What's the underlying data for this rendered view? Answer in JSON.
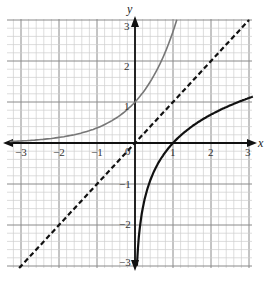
{
  "chart_data": {
    "type": "line",
    "title": "",
    "xlabel": "x",
    "ylabel": "y",
    "xlim": [
      -3.3,
      3.1
    ],
    "ylim": [
      -3.05,
      3.0
    ],
    "grid": true,
    "minor_grid_per_unit": 5,
    "x_ticks": [
      -3,
      -2,
      -1,
      1,
      2,
      3
    ],
    "y_ticks": [
      -3,
      -2,
      -1,
      1,
      2,
      3
    ],
    "x_tick_labels": [
      "−3",
      "−2",
      "−1",
      "1",
      "2",
      "3"
    ],
    "y_tick_labels": [
      "−3",
      "−2",
      "−1",
      "1",
      "2",
      "3"
    ],
    "origin_label": "0",
    "series": [
      {
        "name": "y = e^x",
        "style": "solid",
        "color": "#777777",
        "x": [
          -3.3,
          -3,
          -2.5,
          -2,
          -1.5,
          -1,
          -0.5,
          0,
          0.25,
          0.5,
          0.75,
          1,
          1.1
        ],
        "y": [
          0.037,
          0.05,
          0.082,
          0.135,
          0.223,
          0.368,
          0.607,
          1.0,
          1.284,
          1.649,
          2.117,
          2.718,
          3.0
        ]
      },
      {
        "name": "y = ln x",
        "style": "solid",
        "color": "#111111",
        "x": [
          0.05,
          0.1,
          0.2,
          0.3,
          0.5,
          0.75,
          1,
          1.5,
          2,
          2.5,
          3,
          3.1
        ],
        "y": [
          -3.0,
          -2.303,
          -1.609,
          -1.204,
          -0.693,
          -0.288,
          0,
          0.405,
          0.693,
          0.916,
          1.099,
          1.131
        ]
      },
      {
        "name": "y = x",
        "style": "dashed",
        "color": "#111111",
        "x": [
          -3.05,
          3.0
        ],
        "y": [
          -3.05,
          3.0
        ]
      }
    ]
  },
  "labels": {
    "x_axis": "x",
    "y_axis": "y",
    "origin": "0",
    "xt": [
      "−3",
      "−2",
      "−1",
      "1",
      "2",
      "3"
    ],
    "yt": [
      "3",
      "2",
      "1",
      "−1",
      "−2",
      "−3"
    ]
  }
}
